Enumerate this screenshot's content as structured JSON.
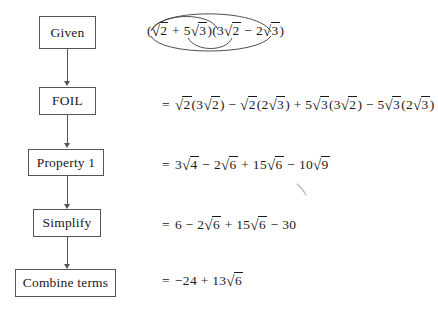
{
  "diagram": {
    "box_border_color": "#555555",
    "text_color": "#1a1a1a",
    "background_color": "#ffffff",
    "steps": [
      {
        "label": "Given",
        "equation_plain": "(√2 + 5√3)(3√2 − 2√3)",
        "has_equals_sign": false
      },
      {
        "label": "FOIL",
        "equation_plain": "= √2(3√2) − √2(2√3) + 5√3(3√2) − 5√3(2√3)",
        "has_equals_sign": true
      },
      {
        "label": "Property 1",
        "equation_plain": "= 3√4 − 2√6 + 15√6 − 10√9",
        "has_equals_sign": true
      },
      {
        "label": "Simplify",
        "equation_plain": "= 6 − 2√6 + 15√6 − 30",
        "has_equals_sign": true
      },
      {
        "label": "Combine terms",
        "equation_plain": "= −24 + 13√6",
        "has_equals_sign": true
      }
    ],
    "symbols": {
      "equals": "=",
      "plus": "+",
      "minus": "−",
      "radical": "√",
      "left_paren": "(",
      "right_paren": ")"
    },
    "given_expression": {
      "left_factor": {
        "open": "(",
        "term1_coefficient": "",
        "term1_radicand": "2",
        "operator": "+",
        "term2_coefficient": "5",
        "term2_radicand": "3",
        "close": ")"
      },
      "right_factor": {
        "open": "(",
        "term1_coefficient": "3",
        "term1_radicand": "2",
        "operator": "−",
        "term2_coefficient": "2",
        "term2_radicand": "3",
        "close": ")"
      }
    },
    "foil_expansion": {
      "equals": "=",
      "terms": [
        {
          "sign": "",
          "coefficient": "",
          "radicand": "2",
          "open": "(",
          "inner_coefficient": "3",
          "inner_radicand": "2",
          "close": ")"
        },
        {
          "sign": "−",
          "coefficient": "",
          "radicand": "2",
          "open": "(",
          "inner_coefficient": "2",
          "inner_radicand": "3",
          "close": ")"
        },
        {
          "sign": "+",
          "coefficient": "5",
          "radicand": "3",
          "open": "(",
          "inner_coefficient": "3",
          "inner_radicand": "2",
          "close": ")"
        },
        {
          "sign": "−",
          "coefficient": "5",
          "radicand": "3",
          "open": "(",
          "inner_coefficient": "2",
          "inner_radicand": "3",
          "close": ")"
        }
      ]
    },
    "property_line": {
      "equals": "=",
      "terms": [
        {
          "sign": "",
          "coefficient": "3",
          "radicand": "4"
        },
        {
          "sign": "−",
          "coefficient": "2",
          "radicand": "6"
        },
        {
          "sign": "+",
          "coefficient": "15",
          "radicand": "6"
        },
        {
          "sign": "−",
          "coefficient": "10",
          "radicand": "9"
        }
      ]
    },
    "simplify_line": {
      "equals": "=",
      "terms": [
        {
          "sign": "",
          "value": "6",
          "radicand": ""
        },
        {
          "sign": "−",
          "coefficient": "2",
          "radicand": "6"
        },
        {
          "sign": "+",
          "coefficient": "15",
          "radicand": "6"
        },
        {
          "sign": "−",
          "value": "30",
          "radicand": ""
        }
      ]
    },
    "combine_line": {
      "equals": "=",
      "constant": "−24",
      "operator": "+",
      "coefficient": "13",
      "radicand": "6"
    },
    "foil_arcs": {
      "count": 4,
      "names": [
        "outer-arc",
        "inner-arc",
        "first-arc",
        "last-arc"
      ],
      "stroke_color": "#3a3a3a"
    }
  }
}
